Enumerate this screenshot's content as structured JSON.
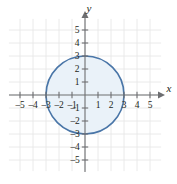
{
  "chart_data": {
    "type": "scatter",
    "title": "",
    "subtitle": "",
    "xlabel": "x",
    "ylabel": "y",
    "xlim": [
      -6,
      6
    ],
    "ylim": [
      -6,
      6
    ],
    "grid": true,
    "legend": null,
    "x_ticks": [
      -5,
      -4,
      -3,
      -2,
      -1,
      1,
      2,
      3,
      4,
      5
    ],
    "y_ticks": [
      5,
      4,
      3,
      2,
      1,
      -1,
      -2,
      -3,
      -4,
      -5
    ],
    "x_tick_labels": [
      "–5",
      "–4",
      "–3",
      "–2",
      "–1",
      "1",
      "2",
      "3",
      "4",
      "5"
    ],
    "y_tick_labels": [
      "5",
      "4",
      "3",
      "2",
      "1",
      "–1",
      "–2",
      "–3",
      "–4",
      "–5"
    ],
    "series": [
      {
        "name": "circle",
        "shape": "circle",
        "center": [
          0,
          0
        ],
        "radius": 3,
        "equation": "x^2 + y^2 = 9",
        "stroke": "#4a76a8",
        "fill": "#eaf2f9",
        "stroke_width": 1.6,
        "key_points": [
          [
            0,
            3
          ],
          [
            3,
            0
          ],
          [
            0,
            -3
          ],
          [
            -3,
            0
          ]
        ]
      }
    ],
    "colors": {
      "curve_stroke": "#4a76a8",
      "curve_fill": "#eaf2f9",
      "axis": "#6d6e71",
      "grid": "#e8e8e8",
      "text": "#231f20",
      "background": "#ffffff"
    },
    "geometry": {
      "origin_px": [
        85,
        95
      ],
      "unit_px": 13.0,
      "grid_extent_units": [
        -5.85,
        5.85
      ]
    }
  },
  "figure": {
    "x_axis_label": "x",
    "y_axis_label": "y"
  }
}
